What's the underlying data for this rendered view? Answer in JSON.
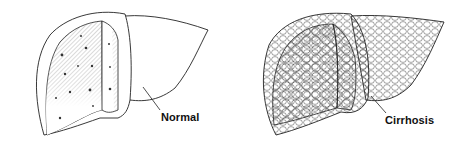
{
  "figure": {
    "panels": [
      {
        "id": "normal",
        "label": "Normal",
        "description": "Normal liver with cut section"
      },
      {
        "id": "cirrhosis",
        "label": "Cirrhosis",
        "description": "Cirrhotic liver with nodular surface and cut section"
      }
    ],
    "colors": {
      "line": "#222222",
      "background": "#ffffff",
      "hatch": "#555555"
    }
  }
}
